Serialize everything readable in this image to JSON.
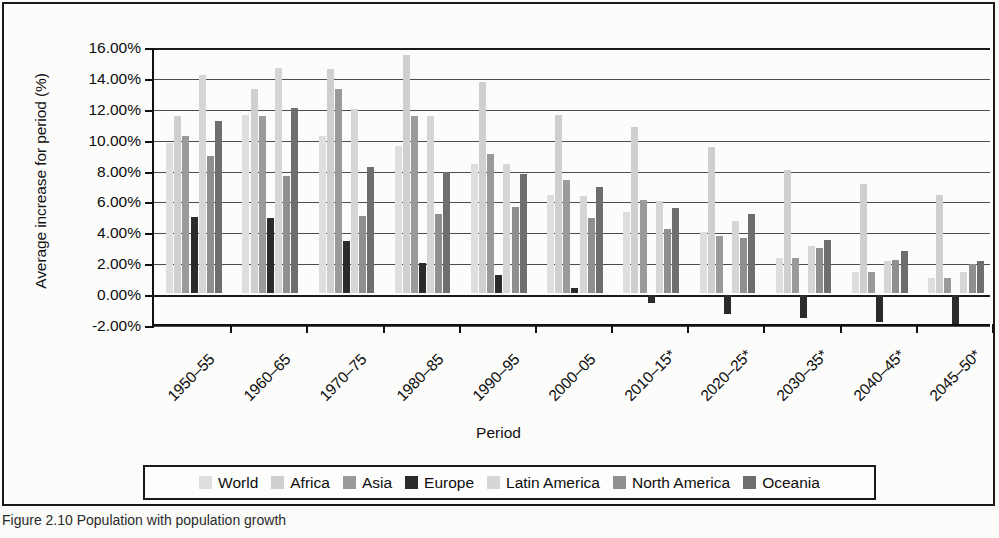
{
  "figure": {
    "caption": "Figure 2.10 Population with population growth"
  },
  "chart_data": {
    "type": "bar",
    "title": "",
    "xlabel": "Period",
    "ylabel": "Average increase for period (%)",
    "ylim": [
      -2,
      16
    ],
    "ytick_labels": [
      "16.00%",
      "14.00%",
      "12.00%",
      "10.00%",
      "8.00%",
      "6.00%",
      "4.00%",
      "2.00%",
      "0.00%",
      "-2.00%"
    ],
    "ytick_values": [
      16,
      14,
      12,
      10,
      8,
      6,
      4,
      2,
      0,
      -2
    ],
    "grid": true,
    "legend_position": "bottom",
    "categories": [
      "1950–55",
      "1960–65",
      "1970–75",
      "1980–85",
      "1990–95",
      "2000–05",
      "2010–15*",
      "2020–25*",
      "2030–35*",
      "2040–45*",
      "2045–50*"
    ],
    "series": [
      {
        "name": "World",
        "color": "#dedede",
        "values": [
          9.7,
          11.55,
          10.15,
          9.55,
          8.35,
          6.35,
          5.25,
          3.95,
          2.25,
          1.4,
          0.95
        ]
      },
      {
        "name": "Africa",
        "color": "#cfcfcf",
        "values": [
          11.5,
          13.2,
          14.5,
          15.4,
          13.65,
          11.55,
          10.75,
          9.45,
          8.0,
          7.05,
          6.35
        ]
      },
      {
        "name": "Asia",
        "color": "#9a9a9a",
        "values": [
          10.15,
          11.5,
          13.25,
          11.45,
          9.0,
          7.35,
          6.0,
          3.7,
          2.25,
          1.35,
          0.95
        ]
      },
      {
        "name": "Europe",
        "color": "#2b2b2b",
        "values": [
          4.9,
          4.85,
          3.35,
          1.95,
          1.15,
          0.35,
          -0.5,
          -1.2,
          -1.45,
          -1.75,
          -1.9
        ]
      },
      {
        "name": "Latin America",
        "color": "#d6d6d6",
        "values": [
          14.15,
          14.55,
          11.95,
          11.45,
          8.35,
          6.3,
          5.95,
          4.65,
          3.05,
          2.05,
          1.35
        ]
      },
      {
        "name": "North America",
        "color": "#8f8f8f",
        "values": [
          8.85,
          7.6,
          5.0,
          5.15,
          5.55,
          4.85,
          4.15,
          3.55,
          2.9,
          2.15,
          1.9
        ]
      },
      {
        "name": "Oceania",
        "color": "#6e6e6e",
        "values": [
          11.15,
          12.0,
          8.15,
          7.85,
          7.7,
          6.85,
          5.5,
          5.1,
          3.45,
          2.75,
          2.05
        ]
      }
    ]
  }
}
